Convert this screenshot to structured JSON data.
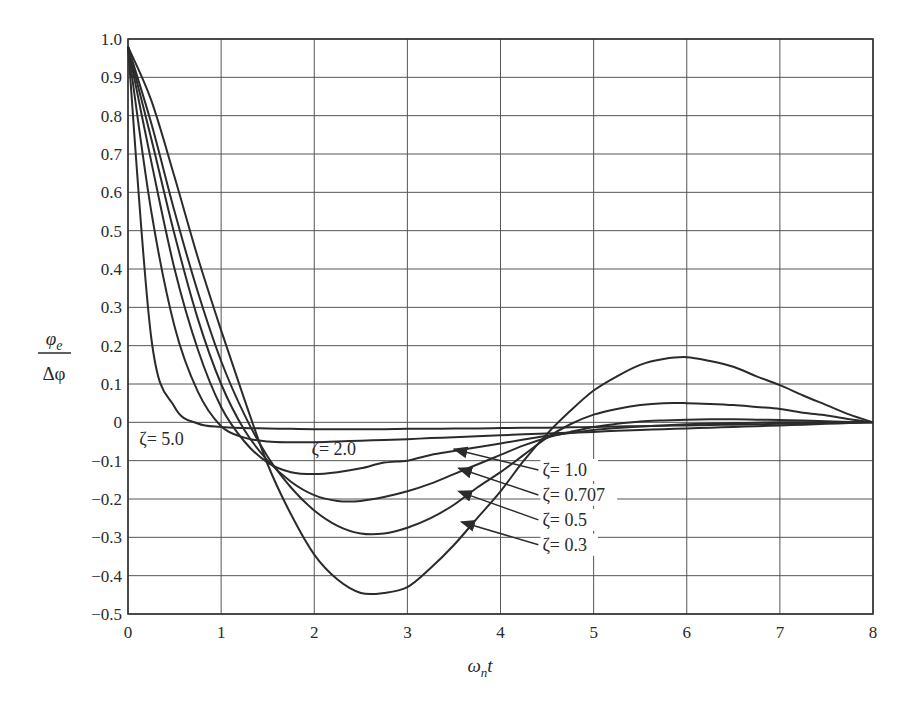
{
  "chart_data": {
    "type": "line",
    "title": "",
    "xlabel": "ω_n t",
    "ylabel": "φ_e / Δφ",
    "xlim": [
      0,
      8
    ],
    "ylim": [
      -0.5,
      1.0
    ],
    "grid": true,
    "x_ticks": [
      "0",
      "1",
      "2",
      "3",
      "4",
      "5",
      "6",
      "7",
      "8"
    ],
    "y_ticks": [
      "1.0",
      "0.9",
      "0.8",
      "0.7",
      "0.6",
      "0.5",
      "0.4",
      "0.3",
      "0.2",
      "0.1",
      "0",
      "−0.1",
      "−0.2",
      "−0.3",
      "−0.4",
      "−0.5"
    ],
    "x": [
      0,
      0.25,
      0.5,
      0.75,
      1,
      1.25,
      1.5,
      1.75,
      2,
      2.25,
      2.5,
      2.75,
      3,
      3.25,
      3.5,
      3.75,
      4,
      4.25,
      4.5,
      4.75,
      5,
      5.25,
      5.5,
      5.75,
      6,
      6.25,
      6.5,
      6.75,
      7,
      7.25,
      7.5,
      7.75,
      8
    ],
    "series": [
      {
        "name": "ζ = 0.3",
        "label": "ζ= 0.3",
        "values": [
          0.98,
          0.84,
          0.64,
          0.43,
          0.24,
          0.06,
          -0.11,
          -0.24,
          -0.345,
          -0.41,
          -0.445,
          -0.445,
          -0.43,
          -0.38,
          -0.32,
          -0.25,
          -0.18,
          -0.1,
          -0.03,
          0.03,
          0.083,
          0.12,
          0.15,
          0.165,
          0.17,
          0.16,
          0.145,
          0.12,
          0.097,
          0.07,
          0.045,
          0.02,
          0.0
        ]
      },
      {
        "name": "ζ = 0.5",
        "label": "ζ= 0.5",
        "values": [
          0.98,
          0.78,
          0.55,
          0.34,
          0.16,
          0.02,
          -0.09,
          -0.17,
          -0.23,
          -0.27,
          -0.29,
          -0.29,
          -0.275,
          -0.25,
          -0.215,
          -0.17,
          -0.13,
          -0.085,
          -0.04,
          -0.005,
          0.02,
          0.035,
          0.045,
          0.05,
          0.05,
          0.048,
          0.045,
          0.04,
          0.035,
          0.025,
          0.018,
          0.008,
          0.0
        ]
      },
      {
        "name": "ζ = 0.707",
        "label": "ζ= 0.707",
        "values": [
          0.98,
          0.74,
          0.49,
          0.27,
          0.1,
          -0.02,
          -0.1,
          -0.155,
          -0.19,
          -0.205,
          -0.205,
          -0.195,
          -0.18,
          -0.16,
          -0.135,
          -0.11,
          -0.085,
          -0.06,
          -0.04,
          -0.025,
          -0.012,
          -0.004,
          0.002,
          0.005,
          0.007,
          0.008,
          0.008,
          0.007,
          0.006,
          0.005,
          0.003,
          0.001,
          0.0
        ]
      },
      {
        "name": "ζ = 1.0",
        "label": "ζ= 1.0",
        "values": [
          0.98,
          0.68,
          0.4,
          0.19,
          0.04,
          -0.05,
          -0.105,
          -0.13,
          -0.135,
          -0.13,
          -0.12,
          -0.105,
          -0.1,
          -0.085,
          -0.075,
          -0.065,
          -0.055,
          -0.045,
          -0.035,
          -0.028,
          -0.02,
          -0.015,
          -0.011,
          -0.008,
          -0.005,
          -0.003,
          -0.002,
          -0.001,
          0.0,
          0.0,
          0.0,
          0.0,
          0.0
        ]
      },
      {
        "name": "ζ = 2.0",
        "label": "ζ= 2.0",
        "values": [
          0.98,
          0.55,
          0.25,
          0.08,
          -0.01,
          -0.04,
          -0.05,
          -0.052,
          -0.052,
          -0.05,
          -0.048,
          -0.046,
          -0.044,
          -0.041,
          -0.039,
          -0.036,
          -0.034,
          -0.031,
          -0.029,
          -0.027,
          -0.025,
          -0.022,
          -0.02,
          -0.018,
          -0.016,
          -0.014,
          -0.012,
          -0.01,
          -0.008,
          -0.006,
          -0.004,
          -0.002,
          0.0
        ]
      },
      {
        "name": "ζ = 5.0",
        "label": "ζ= 5.0",
        "values": [
          0.98,
          0.22,
          0.04,
          -0.003,
          -0.012,
          -0.015,
          -0.016,
          -0.017,
          -0.018,
          -0.018,
          -0.018,
          -0.018,
          -0.017,
          -0.017,
          -0.016,
          -0.016,
          -0.015,
          -0.014,
          -0.014,
          -0.013,
          -0.012,
          -0.011,
          -0.01,
          -0.009,
          -0.008,
          -0.007,
          -0.006,
          -0.005,
          -0.004,
          -0.003,
          -0.002,
          -0.001,
          0.0
        ]
      }
    ],
    "annotations": [
      {
        "text": "ζ= 5.0",
        "x": 0.12,
        "y": -0.06
      },
      {
        "text": "ζ= 2.0",
        "x": 1.97,
        "y": -0.085
      },
      {
        "text": "ζ= 1.0",
        "x": 4.45,
        "y": -0.14,
        "arrow_to": [
          3.5,
          -0.07
        ]
      },
      {
        "text": "ζ= 0.707",
        "x": 4.45,
        "y": -0.205,
        "arrow_to": [
          3.55,
          -0.12
        ]
      },
      {
        "text": "ζ= 0.5",
        "x": 4.45,
        "y": -0.27,
        "arrow_to": [
          3.55,
          -0.18
        ]
      },
      {
        "text": "ζ= 0.3",
        "x": 4.45,
        "y": -0.335,
        "arrow_to": [
          3.58,
          -0.26
        ]
      }
    ]
  },
  "axes": {
    "xlabel_main": "ω",
    "xlabel_sub": "n",
    "xlabel_tail": "t",
    "ylabel_num": "φ",
    "ylabel_num_sub": "e",
    "ylabel_den": "Δφ"
  }
}
